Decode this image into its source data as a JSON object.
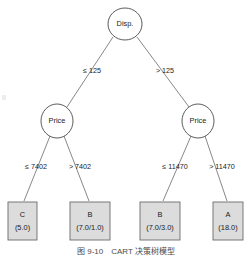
{
  "figure": {
    "type": "decision-tree",
    "caption": "图 9-10　CART 决策树模型",
    "background_color": "#ffffff",
    "leaf_fill_color": "#dcdcdc",
    "node_stroke_color": "#4a4a4a"
  },
  "tree": {
    "root": {
      "id": "root",
      "label": "Disp.",
      "shape": "ellipse",
      "cx": 125,
      "cy": 24,
      "rx": 17,
      "ry": 16
    },
    "internal_nodes": [
      {
        "id": "price-left",
        "label": "Price",
        "shape": "ellipse",
        "cx": 57,
        "cy": 121,
        "rx": 16,
        "ry": 17
      },
      {
        "id": "price-right",
        "label": "Price",
        "shape": "ellipse",
        "cx": 198,
        "cy": 121,
        "rx": 16,
        "ry": 17
      }
    ],
    "leaves": [
      {
        "id": "leaf-c",
        "class_label": "C",
        "counts": "(5.0)",
        "shape": "rect",
        "x": 8,
        "y": 202,
        "w": 29,
        "h": 38
      },
      {
        "id": "leaf-b1",
        "class_label": "B",
        "counts": "(7.0/1.0)",
        "shape": "rect",
        "x": 70,
        "y": 202,
        "w": 40,
        "h": 38
      },
      {
        "id": "leaf-b2",
        "class_label": "B",
        "counts": "(7.0/3.0)",
        "shape": "rect",
        "x": 140,
        "y": 202,
        "w": 40,
        "h": 38
      },
      {
        "id": "leaf-a",
        "class_label": "A",
        "counts": "(18.0)",
        "shape": "rect",
        "x": 213,
        "y": 202,
        "w": 30,
        "h": 38
      }
    ],
    "edges": [
      {
        "id": "edge-root-left",
        "from": "root",
        "to": "price-left",
        "label": "≤ 125",
        "label_x": 92,
        "label_y": 71,
        "x1": 113,
        "y1": 37,
        "x2": 67,
        "y2": 107
      },
      {
        "id": "edge-root-right",
        "from": "root",
        "to": "price-right",
        "label": "> 125",
        "label_x": 164,
        "label_y": 71,
        "x1": 137,
        "y1": 37,
        "x2": 189,
        "y2": 107
      },
      {
        "id": "edge-priceleft-c",
        "from": "price-left",
        "to": "leaf-c",
        "label": "≤ 7402",
        "label_x": 36,
        "label_y": 167,
        "x1": 50,
        "y1": 136,
        "x2": 24,
        "y2": 200
      },
      {
        "id": "edge-priceleft-b1",
        "from": "price-left",
        "to": "leaf-b1",
        "label": "> 7402",
        "label_x": 79,
        "label_y": 167,
        "x1": 64,
        "y1": 136,
        "x2": 89,
        "y2": 200
      },
      {
        "id": "edge-priceright-b2",
        "from": "price-right",
        "to": "leaf-b2",
        "label": "≤ 11470",
        "label_x": 174,
        "label_y": 167,
        "x1": 191,
        "y1": 136,
        "x2": 163,
        "y2": 200
      },
      {
        "id": "edge-priceright-a",
        "from": "price-right",
        "to": "leaf-a",
        "label": "> 11470",
        "label_x": 221,
        "label_y": 167,
        "x1": 205,
        "y1": 136,
        "x2": 227,
        "y2": 200
      }
    ]
  }
}
